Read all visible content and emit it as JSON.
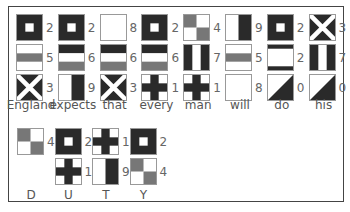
{
  "colors": {
    "black": "#2a2a2a",
    "white": "#ffffff",
    "gray": "#777777",
    "border": "#999999"
  },
  "message": {
    "words": [
      {
        "word": "England",
        "flags": [
          {
            "digit": "2",
            "pattern": "square"
          },
          {
            "digit": "5",
            "pattern": "h-white-gray-white"
          },
          {
            "digit": "3",
            "pattern": "saltire"
          }
        ]
      },
      {
        "word": "expects",
        "flags": [
          {
            "digit": "2",
            "pattern": "square"
          },
          {
            "digit": "6",
            "pattern": "h-black-white-gray"
          },
          {
            "digit": "9",
            "pattern": "v-white-black"
          }
        ]
      },
      {
        "word": "that",
        "flags": [
          {
            "digit": "8",
            "pattern": "plain-white"
          },
          {
            "digit": "6",
            "pattern": "h-black-white-gray"
          },
          {
            "digit": "3",
            "pattern": "saltire"
          }
        ]
      },
      {
        "word": "every",
        "flags": [
          {
            "digit": "2",
            "pattern": "square"
          },
          {
            "digit": "6",
            "pattern": "h-black-white-gray"
          },
          {
            "digit": "1",
            "pattern": "cross"
          }
        ]
      },
      {
        "word": "man",
        "flags": [
          {
            "digit": "4",
            "pattern": "quartered"
          },
          {
            "digit": "7",
            "pattern": "v-black-white-black"
          },
          {
            "digit": "1",
            "pattern": "cross"
          }
        ]
      },
      {
        "word": "will",
        "flags": [
          {
            "digit": "9",
            "pattern": "v-white-black"
          },
          {
            "digit": "5",
            "pattern": "h-white-gray-white"
          },
          {
            "digit": "8",
            "pattern": "plain-white"
          }
        ]
      },
      {
        "word": "do",
        "flags": [
          {
            "digit": "2",
            "pattern": "square"
          },
          {
            "digit": "2",
            "pattern": "h-black-white-black-thin"
          },
          {
            "digit": "0",
            "pattern": "diagonal"
          }
        ]
      },
      {
        "word": "his",
        "flags": [
          {
            "digit": "3",
            "pattern": "saltire"
          },
          {
            "digit": "7",
            "pattern": "v-black-white-black"
          },
          {
            "digit": "0",
            "pattern": "diagonal"
          }
        ]
      }
    ]
  },
  "spelled": {
    "letters": [
      {
        "letter": "D",
        "flags": [
          {
            "digit": "4",
            "pattern": "quartered"
          }
        ]
      },
      {
        "letter": "U",
        "flags": [
          {
            "digit": "2",
            "pattern": "square"
          },
          {
            "digit": "1",
            "pattern": "cross"
          }
        ]
      },
      {
        "letter": "T",
        "flags": [
          {
            "digit": "1",
            "pattern": "cross"
          },
          {
            "digit": "9",
            "pattern": "v-white-black"
          }
        ]
      },
      {
        "letter": "Y",
        "flags": [
          {
            "digit": "2",
            "pattern": "square"
          },
          {
            "digit": "4",
            "pattern": "quartered"
          }
        ]
      }
    ]
  }
}
